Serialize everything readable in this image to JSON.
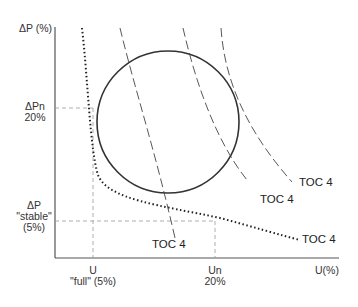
{
  "diagram": {
    "y_axis": {
      "label": "ΔP (%)"
    },
    "x_axis": {
      "label": "U(%)"
    },
    "y_markers": {
      "pn": {
        "line1": "ΔPn",
        "line2": "20%"
      },
      "stable": {
        "line1": "ΔP",
        "line2": "\"stable\"",
        "line3": "(5%)"
      }
    },
    "x_markers": {
      "full": {
        "line1": "U",
        "line2": "\"full\" (5%)"
      },
      "un": {
        "line1": "Un",
        "line2": "20%"
      }
    },
    "curve_labels": [
      "TOC 4",
      "TOC 4",
      "TOC 4",
      "TOC 4"
    ],
    "colors": {
      "line": "#222222",
      "guide": "#888888"
    }
  }
}
